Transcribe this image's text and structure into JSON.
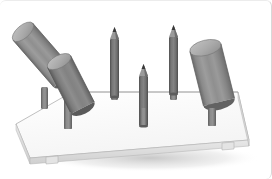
{
  "image": {
    "title": "3D rendered scene of cylindrical objects on a platform",
    "background_color": "#ffffff",
    "frame_color": "#d8d8d8",
    "width": 272,
    "height": 179
  },
  "scene": {
    "platform": {
      "name": "platform-slab",
      "description": "flat rectangular white slab in perspective",
      "top_color": "#fcfcfc",
      "edge_color": "#e0e0e0",
      "side_color": "#d0d0d0",
      "outline_color": "#9a9a9a",
      "notches": 2
    },
    "objects": [
      {
        "name": "tilted-cylinder-upper-left",
        "type": "cylinder",
        "orientation": "tilted",
        "body_color": "#8d8d8d",
        "cap_color": "#b4b4b4",
        "shade_color": "#6e6e6e"
      },
      {
        "name": "tilted-cylinder-lower-left",
        "type": "cylinder",
        "orientation": "tilted",
        "body_color": "#8d8d8d",
        "cap_color": "#b4b4b4",
        "shade_color": "#6e6e6e"
      },
      {
        "name": "pencil-left",
        "type": "pencil",
        "orientation": "vertical",
        "body_color": "#6f6f6f",
        "tip_color": "#4a4a4a"
      },
      {
        "name": "pencil-center",
        "type": "pencil",
        "orientation": "vertical",
        "body_color": "#6f6f6f",
        "tip_color": "#4a4a4a"
      },
      {
        "name": "pencil-right",
        "type": "pencil",
        "orientation": "vertical",
        "body_color": "#6f6f6f",
        "tip_color": "#4a4a4a"
      },
      {
        "name": "tilted-cylinder-right",
        "type": "cylinder",
        "orientation": "tilted",
        "body_color": "#8d8d8d",
        "cap_color": "#b4b4b4",
        "shade_color": "#6e6e6e"
      }
    ],
    "posts": {
      "name": "support-post",
      "count": 6,
      "body_color": "#8a8a8a",
      "shade_color": "#6a6a6a"
    }
  }
}
